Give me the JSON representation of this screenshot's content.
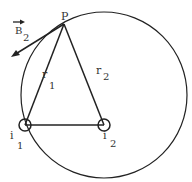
{
  "diagram": {
    "labels": {
      "P": "P",
      "B": "B",
      "B_sub": "2",
      "r1": "r",
      "r1_sub": "1",
      "r2": "r",
      "r2_sub": "2",
      "i1": "i",
      "i1_sub": "1",
      "i2": "i",
      "i2_sub": "2"
    },
    "points": {
      "P": [
        64,
        14
      ],
      "wire1": [
        25,
        125
      ],
      "wire2": [
        104,
        125
      ]
    },
    "circle": {
      "cx": 104,
      "cy": 95,
      "r": 83
    },
    "colors": {
      "stroke": "#222222",
      "text": "#333333"
    }
  }
}
